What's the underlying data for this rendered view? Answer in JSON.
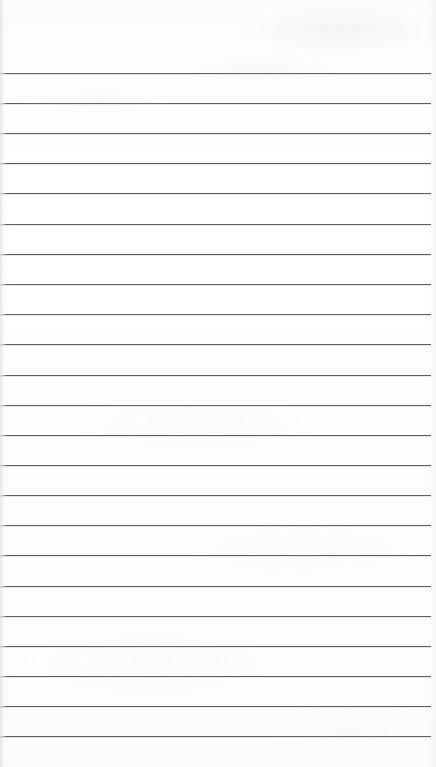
{
  "document": {
    "kind": "scanned-lined-paper",
    "title": "Blank lined notepad page",
    "page_width": 436,
    "page_height": 767,
    "content_text": "",
    "has_handwriting": false,
    "has_printed_text": false
  },
  "paper": {
    "background_color": "#fdfdfd",
    "surface_tint": "#fefefe",
    "texture_description": "faint grey scanner mottling, strongest in the upper right",
    "left_edge_shadow_color": "#aaaeb6",
    "right_edge_shadow_color": "#bcc0c7"
  },
  "ruling": {
    "line_color": "#5c5f66",
    "line_thickness_px": 1,
    "line_spacing_px": 30.1,
    "first_line_y": 73,
    "left_inset_px": 0,
    "right_inset_px": 5,
    "line_count": 23,
    "lines": [
      {
        "index": 1,
        "y": 73,
        "left": 0,
        "right": 5
      },
      {
        "index": 2,
        "y": 103,
        "left": 0,
        "right": 5
      },
      {
        "index": 3,
        "y": 133,
        "left": 0,
        "right": 5
      },
      {
        "index": 4,
        "y": 163,
        "left": 0,
        "right": 5
      },
      {
        "index": 5,
        "y": 193,
        "left": 0,
        "right": 5
      },
      {
        "index": 6,
        "y": 224,
        "left": 0,
        "right": 5
      },
      {
        "index": 7,
        "y": 254,
        "left": 0,
        "right": 5
      },
      {
        "index": 8,
        "y": 284,
        "left": 0,
        "right": 5
      },
      {
        "index": 9,
        "y": 314,
        "left": 0,
        "right": 5
      },
      {
        "index": 10,
        "y": 344,
        "left": 0,
        "right": 5
      },
      {
        "index": 11,
        "y": 375,
        "left": 0,
        "right": 5
      },
      {
        "index": 12,
        "y": 405,
        "left": 0,
        "right": 5
      },
      {
        "index": 13,
        "y": 435,
        "left": 0,
        "right": 5
      },
      {
        "index": 14,
        "y": 465,
        "left": 0,
        "right": 5
      },
      {
        "index": 15,
        "y": 495,
        "left": 0,
        "right": 5
      },
      {
        "index": 16,
        "y": 525,
        "left": 0,
        "right": 5
      },
      {
        "index": 17,
        "y": 555,
        "left": 0,
        "right": 5
      },
      {
        "index": 18,
        "y": 586,
        "left": 0,
        "right": 5
      },
      {
        "index": 19,
        "y": 616,
        "left": 0,
        "right": 5
      },
      {
        "index": 20,
        "y": 646,
        "left": 0,
        "right": 5
      },
      {
        "index": 21,
        "y": 676,
        "left": 0,
        "right": 5
      },
      {
        "index": 22,
        "y": 706,
        "left": 0,
        "right": 5
      },
      {
        "index": 23,
        "y": 736,
        "left": 0,
        "right": 5
      }
    ]
  },
  "regions": {
    "top_margin_height_px": 73,
    "bottom_margin_height_px": 31
  }
}
